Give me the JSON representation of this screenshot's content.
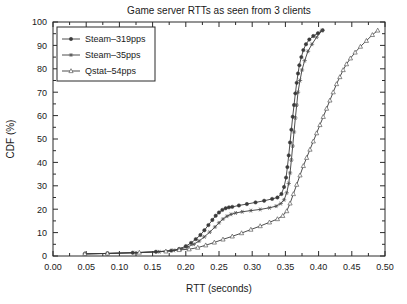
{
  "chart_data": {
    "type": "line",
    "title": "Game server RTTs as seen from 3 clients",
    "xlabel": "RTT (seconds)",
    "ylabel": "CDF (%)",
    "xlim": [
      0.0,
      0.5
    ],
    "ylim": [
      0,
      100
    ],
    "xticks": [
      "0.00",
      "0.05",
      "0.10",
      "0.15",
      "0.20",
      "0.25",
      "0.30",
      "0.35",
      "0.40",
      "0.45",
      "0.50"
    ],
    "xtick_values": [
      0.0,
      0.05,
      0.1,
      0.15,
      0.2,
      0.25,
      0.3,
      0.35,
      0.4,
      0.45,
      0.5
    ],
    "yticks": [
      "0",
      "10",
      "20",
      "30",
      "40",
      "50",
      "60",
      "70",
      "80",
      "90",
      "100"
    ],
    "ytick_values": [
      0,
      10,
      20,
      30,
      40,
      50,
      60,
      70,
      80,
      90,
      100
    ],
    "grid": false,
    "legend_position": "upper-left",
    "series": [
      {
        "name": "Steam–319pps",
        "marker": "filled-circle",
        "color": "#3a3a3a",
        "x": [
          0.048,
          0.082,
          0.12,
          0.155,
          0.178,
          0.19,
          0.2,
          0.208,
          0.215,
          0.222,
          0.228,
          0.234,
          0.24,
          0.245,
          0.25,
          0.255,
          0.26,
          0.265,
          0.27,
          0.28,
          0.292,
          0.305,
          0.318,
          0.33,
          0.338,
          0.344,
          0.348,
          0.351,
          0.353,
          0.355,
          0.357,
          0.359,
          0.361,
          0.363,
          0.365,
          0.367,
          0.369,
          0.371,
          0.374,
          0.377,
          0.381,
          0.386,
          0.392,
          0.399,
          0.406
        ],
        "y": [
          0.9,
          1.1,
          1.4,
          1.8,
          2.3,
          3.0,
          4.2,
          5.6,
          7.2,
          9.0,
          11.0,
          13.2,
          15.4,
          17.2,
          18.6,
          19.7,
          20.4,
          20.8,
          21.0,
          21.6,
          22.2,
          22.9,
          23.6,
          24.4,
          25.0,
          26.5,
          29.5,
          33.5,
          38.0,
          43.0,
          48.5,
          54.0,
          59.5,
          64.5,
          69.5,
          74.0,
          78.0,
          81.5,
          85.0,
          88.0,
          90.5,
          92.5,
          94.0,
          95.2,
          96.5
        ]
      },
      {
        "name": "Steam–35pps",
        "marker": "star",
        "color": "#4a4a4a",
        "x": [
          0.048,
          0.082,
          0.125,
          0.16,
          0.182,
          0.192,
          0.202,
          0.212,
          0.22,
          0.228,
          0.236,
          0.244,
          0.25,
          0.256,
          0.262,
          0.268,
          0.275,
          0.285,
          0.298,
          0.312,
          0.326,
          0.336,
          0.343,
          0.348,
          0.352,
          0.355,
          0.357,
          0.359,
          0.361,
          0.363,
          0.365,
          0.367,
          0.369,
          0.372,
          0.375,
          0.379,
          0.384,
          0.39,
          0.397,
          0.405
        ],
        "y": [
          0.9,
          1.1,
          1.4,
          1.8,
          2.4,
          3.0,
          3.8,
          5.0,
          6.4,
          8.2,
          10.2,
          12.4,
          14.2,
          15.8,
          17.0,
          17.8,
          18.4,
          18.9,
          19.4,
          19.9,
          20.6,
          21.3,
          22.4,
          24.0,
          27.0,
          31.0,
          35.5,
          41.0,
          47.0,
          53.0,
          59.0,
          64.5,
          70.0,
          75.0,
          79.5,
          83.5,
          87.5,
          90.5,
          93.5,
          96.3
        ]
      },
      {
        "name": "Qstat–54pps",
        "marker": "open-triangle",
        "color": "#5a5a5a",
        "x": [
          0.048,
          0.082,
          0.13,
          0.17,
          0.19,
          0.205,
          0.218,
          0.23,
          0.243,
          0.256,
          0.27,
          0.284,
          0.298,
          0.312,
          0.326,
          0.338,
          0.346,
          0.352,
          0.357,
          0.362,
          0.367,
          0.372,
          0.377,
          0.382,
          0.387,
          0.392,
          0.397,
          0.402,
          0.407,
          0.412,
          0.417,
          0.422,
          0.427,
          0.432,
          0.437,
          0.442,
          0.448,
          0.455,
          0.463,
          0.472,
          0.481,
          0.489
        ],
        "y": [
          0.9,
          1.1,
          1.5,
          2.0,
          2.6,
          2.9,
          3.6,
          4.6,
          5.8,
          7.1,
          8.4,
          9.8,
          11.3,
          12.8,
          14.4,
          15.8,
          17.2,
          19.2,
          22.5,
          26.5,
          30.5,
          34.5,
          38.5,
          42.0,
          45.5,
          49.0,
          52.5,
          56.0,
          59.5,
          63.0,
          66.5,
          70.0,
          73.5,
          76.5,
          79.5,
          82.0,
          84.5,
          87.0,
          89.5,
          92.0,
          94.5,
          96.4
        ]
      }
    ]
  }
}
